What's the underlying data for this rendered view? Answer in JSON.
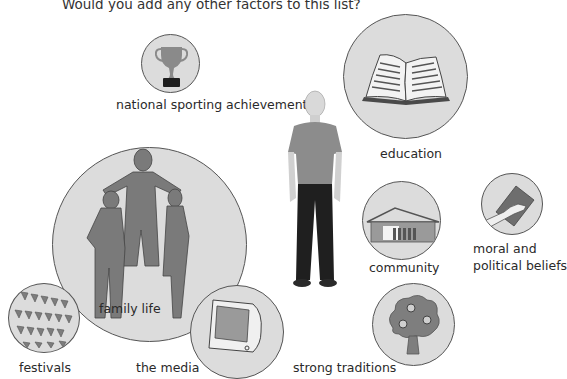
{
  "prompt": "Would you add any other factors to this list?",
  "center_figure": {
    "icon": "person-icon",
    "description": "standing man in grey t-shirt and dark trousers"
  },
  "factors": [
    {
      "label": "national sporting achievements",
      "icon": "trophy-icon"
    },
    {
      "label": "education",
      "icon": "open-book-icon"
    },
    {
      "label": "family life",
      "icon": "family-silhouette-icon"
    },
    {
      "label": "community",
      "icon": "house-icon"
    },
    {
      "label": "moral and",
      "label2": "political beliefs",
      "icon": "hand-on-book-icon"
    },
    {
      "label": "festivals",
      "icon": "bunting-icon"
    },
    {
      "label": "the media",
      "icon": "television-icon"
    },
    {
      "label": "strong traditions",
      "icon": "tree-icon"
    }
  ],
  "colors": {
    "circle_fill": "#dcdcdc",
    "circle_stroke": "#555555",
    "silhouette": "#7a7a7a",
    "text": "#2a2a2a"
  }
}
